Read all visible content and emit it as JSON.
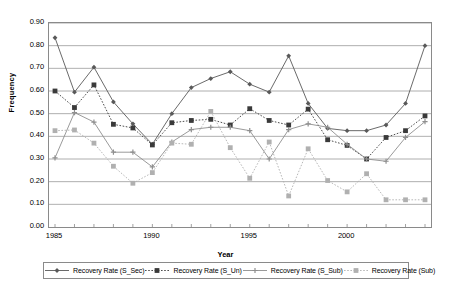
{
  "chart_data": {
    "type": "line",
    "title": "",
    "xlabel": "Year",
    "ylabel": "Frequency",
    "ylim": [
      0.0,
      0.9
    ],
    "ytick_labels": [
      "0.90",
      "0.80",
      "0.70",
      "0.60",
      "0.50",
      "0.40",
      "0.30",
      "0.20",
      "0.10",
      "0.00"
    ],
    "ytick_values": [
      0.9,
      0.8,
      0.7,
      0.6,
      0.5,
      0.4,
      0.3,
      0.2,
      0.1,
      0.0
    ],
    "xtick_labels": [
      "1985",
      "1990",
      "1995",
      "2000"
    ],
    "xtick_values": [
      1985,
      1990,
      1995,
      2000
    ],
    "x": [
      1985,
      1986,
      1987,
      1988,
      1989,
      1990,
      1991,
      1992,
      1993,
      1994,
      1995,
      1996,
      1997,
      1998,
      1999,
      2000,
      2001,
      2002,
      2003,
      2004
    ],
    "grid": "horizontal",
    "legend_position": "bottom",
    "series": [
      {
        "name": "Recovery Rate (S_Sec)",
        "color": "#595959",
        "marker": "diamond",
        "line": "solid",
        "values": [
          0.835,
          0.595,
          0.705,
          0.552,
          0.455,
          0.365,
          0.5,
          0.615,
          0.655,
          0.685,
          0.63,
          0.595,
          0.755,
          0.545,
          0.435,
          0.425,
          0.425,
          0.45,
          0.545,
          0.8
        ]
      },
      {
        "name": "Recovery Rate (S_Un)",
        "color": "#3a3a3a",
        "marker": "square",
        "line": "dotted",
        "values": [
          0.6,
          0.527,
          0.627,
          0.453,
          0.437,
          0.362,
          0.46,
          0.47,
          0.475,
          0.45,
          0.522,
          0.47,
          0.45,
          0.52,
          0.385,
          0.36,
          0.3,
          0.395,
          0.425,
          0.49
        ]
      },
      {
        "name": "Recovery Rate (S_Sub)",
        "color": "#8f8f8f",
        "marker": "plus",
        "line": "solid",
        "values": [
          0.305,
          0.505,
          0.463,
          0.33,
          0.33,
          0.265,
          0.375,
          0.43,
          0.44,
          0.44,
          0.425,
          0.3,
          0.43,
          0.455,
          0.44,
          0.365,
          0.3,
          0.29,
          0.395,
          0.465
        ]
      },
      {
        "name": "Recovery Rate (Sub)",
        "color": "#b0b0b0",
        "marker": "square",
        "line": "dotted",
        "values": [
          0.425,
          0.428,
          0.37,
          0.268,
          0.193,
          0.24,
          0.37,
          0.365,
          0.51,
          0.35,
          0.215,
          0.375,
          0.137,
          0.345,
          0.205,
          0.155,
          0.235,
          0.12,
          0.12,
          0.12
        ]
      }
    ]
  },
  "axis": {
    "y_title": "Frequency",
    "x_title": "Year"
  }
}
